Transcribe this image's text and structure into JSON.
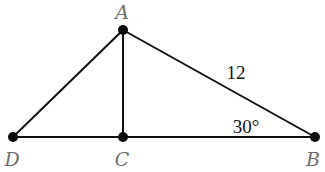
{
  "diagram": {
    "type": "geometry-triangle",
    "points": [
      {
        "id": "A",
        "label": "A",
        "x": 123,
        "y": 30,
        "label_x": 122,
        "label_y": 19
      },
      {
        "id": "D",
        "label": "D",
        "x": 13,
        "y": 137,
        "label_x": 12,
        "label_y": 166
      },
      {
        "id": "C",
        "label": "C",
        "x": 123,
        "y": 137,
        "label_x": 122,
        "label_y": 166
      },
      {
        "id": "B",
        "label": "B",
        "x": 315,
        "y": 137,
        "label_x": 313,
        "label_y": 166
      }
    ],
    "segments": [
      {
        "from": "A",
        "to": "D"
      },
      {
        "from": "A",
        "to": "C"
      },
      {
        "from": "A",
        "to": "B"
      },
      {
        "from": "D",
        "to": "B"
      }
    ],
    "annotations": {
      "side_AB": {
        "text": "12",
        "x": 236,
        "y": 79
      },
      "angle_B": {
        "text": "30°",
        "x": 246,
        "y": 133
      }
    }
  },
  "colors": {
    "line": "#111111",
    "point": "#0a0a0a",
    "vertex_label": "#6e6e6e",
    "measure_label": "#111111",
    "background": "#ffffff"
  }
}
